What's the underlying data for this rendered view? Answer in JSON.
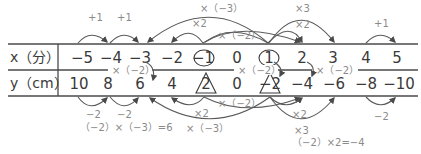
{
  "table": {
    "x_header": "x（分）",
    "y_header": "y（cm）",
    "x_values": [
      "−5",
      "−4",
      "−3",
      "−2",
      "−1",
      "0",
      "1",
      "2",
      "3",
      "4",
      "5"
    ],
    "y_values": [
      "10",
      "8",
      "6",
      "4",
      "2",
      "0",
      "−2",
      "−4",
      "−6",
      "−8",
      "−10"
    ],
    "circled_x": [
      "−1",
      "1"
    ],
    "triangled_y": [
      "2",
      "−2"
    ]
  },
  "annotations_top": {
    "plus1_a": "+1",
    "plus1_b": "+1",
    "times_neg3": "×（−3）",
    "times2_left": "×2",
    "times_neg2": "×（−2）",
    "times3": "×3",
    "times2_right": "×2",
    "plus1_c": "+1"
  },
  "annotations_mid": {
    "times_neg2_a": "×（−2）",
    "times_neg2_b": "×（−2）",
    "times_neg2_c": "×（−2）"
  },
  "annotations_bottom": {
    "minus2_a": "−2",
    "minus2_b": "−2",
    "calc_left": "（−2）×（−3）=6",
    "times2_left": "×2",
    "times_neg2": "×（−2）",
    "times_neg3": "×（−3）",
    "times2_right": "×2",
    "times3": "×3",
    "calc_right": "（−2）×2=−4",
    "minus2_c": "−2"
  }
}
